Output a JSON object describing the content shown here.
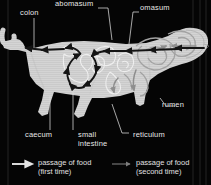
{
  "figure": {
    "background_color": "#050505",
    "body_color": "#d4d4d4",
    "first_pass_color": "#1a1a1a",
    "second_pass_color": "#8e8e8e",
    "label_color": "#e8e8e8"
  },
  "labels": [
    {
      "id": "colon",
      "text": "colon"
    },
    {
      "id": "abomasum",
      "text": "abomasum"
    },
    {
      "id": "omasum",
      "text": "omasum"
    },
    {
      "id": "rumen",
      "text": "rumen"
    },
    {
      "id": "caecum",
      "text": "caecum"
    },
    {
      "id": "small-intestine",
      "text": "small\nintestine"
    },
    {
      "id": "small-intestine-line1",
      "text": "small"
    },
    {
      "id": "small-intestine-line2",
      "text": "intestine"
    },
    {
      "id": "reticulum",
      "text": "reticulum"
    }
  ],
  "legend": {
    "first": {
      "line1": "passage of food",
      "line2": "(first time)",
      "arrow_color": "#e5e5e5"
    },
    "second": {
      "line1": "passage of food",
      "line2": "(second time)",
      "arrow_color": "#7d7d7d"
    }
  }
}
